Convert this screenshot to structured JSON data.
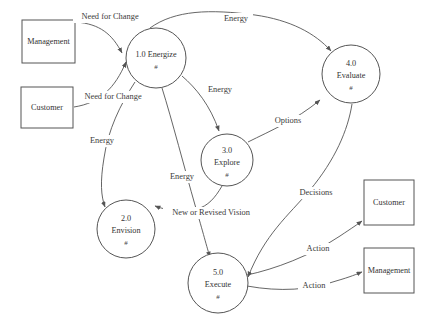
{
  "diagram": {
    "type": "data-flow-diagram",
    "background_color": "#ffffff",
    "stroke_color": "#555555",
    "text_color": "#333333",
    "process_marker": "#",
    "external_entities": [
      {
        "id": "management-left",
        "label": "Management",
        "x": 22,
        "y": 20,
        "w": 53,
        "h": 43
      },
      {
        "id": "customer-left",
        "label": "Customer",
        "x": 21,
        "y": 87,
        "w": 52,
        "h": 41
      },
      {
        "id": "customer-right",
        "label": "Customer",
        "x": 364,
        "y": 180,
        "w": 50,
        "h": 45
      },
      {
        "id": "management-right",
        "label": "Management",
        "x": 364,
        "y": 248,
        "w": 50,
        "h": 45
      }
    ],
    "processes": [
      {
        "id": "p1",
        "number": "1.0",
        "name": "Energize",
        "single_line_label": "1.0 Energize",
        "marker": "#",
        "cx": 156,
        "cy": 58,
        "r": 30
      },
      {
        "id": "p2",
        "number": "2.0",
        "name": "Envision",
        "marker": "#",
        "cx": 126,
        "cy": 229,
        "r": 29
      },
      {
        "id": "p3",
        "number": "3.0",
        "name": "Explore",
        "marker": "#",
        "cx": 227,
        "cy": 160,
        "r": 26
      },
      {
        "id": "p4",
        "number": "4.0",
        "name": "Evaluate",
        "marker": "#",
        "cx": 351,
        "cy": 74,
        "r": 29
      },
      {
        "id": "p5",
        "number": "5.0",
        "name": "Execute",
        "marker": "#",
        "cx": 218,
        "cy": 283,
        "r": 30
      }
    ],
    "flows": [
      {
        "id": "f1",
        "label": "Need for Change",
        "from": "management-left",
        "to": "p1",
        "label_x": 110,
        "label_y": 17
      },
      {
        "id": "f2",
        "label": "Need for Change",
        "from": "customer-left",
        "to": "p1",
        "label_x": 113,
        "label_y": 97
      },
      {
        "id": "f3",
        "label": "Energy",
        "from": "p1",
        "to": "p4",
        "label_x": 236,
        "label_y": 19
      },
      {
        "id": "f4",
        "label": "Energy",
        "from": "p1",
        "to": "p2",
        "label_x": 102,
        "label_y": 141
      },
      {
        "id": "f5",
        "label": "Energy",
        "from": "p1",
        "to": "p3",
        "label_x": 220,
        "label_y": 90
      },
      {
        "id": "f6",
        "label": "Energy",
        "from": "p1",
        "to": "p5",
        "label_x": 182,
        "label_y": 177
      },
      {
        "id": "f7",
        "label": "Options",
        "from": "p3",
        "to": "p4",
        "label_x": 288,
        "label_y": 121
      },
      {
        "id": "f8",
        "label": "New or Revised Vision",
        "from": "p3",
        "to": "p2",
        "label_x": 211,
        "label_y": 213
      },
      {
        "id": "f9",
        "label": "Decisions",
        "from": "p4",
        "to": "p5",
        "label_x": 316,
        "label_y": 193
      },
      {
        "id": "f10",
        "label": "Action",
        "from": "p5",
        "to": "customer-right",
        "label_x": 318,
        "label_y": 249
      },
      {
        "id": "f11",
        "label": "Action",
        "from": "p5",
        "to": "management-right",
        "label_x": 314,
        "label_y": 286
      }
    ]
  }
}
